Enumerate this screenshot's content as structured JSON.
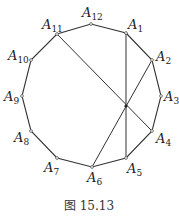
{
  "figure": {
    "caption": "图 15.13",
    "polygon": "regular dodecagon",
    "vertices": [
      {
        "name": "A",
        "sub": "1",
        "x": 126,
        "y": 33,
        "lx": 128,
        "ly": 29,
        "anchor": "start"
      },
      {
        "name": "A",
        "sub": "2",
        "x": 152,
        "y": 60,
        "lx": 156,
        "ly": 61,
        "anchor": "start"
      },
      {
        "name": "A",
        "sub": "3",
        "x": 161,
        "y": 96,
        "lx": 164,
        "ly": 101,
        "anchor": "start"
      },
      {
        "name": "A",
        "sub": "4",
        "x": 152,
        "y": 131,
        "lx": 156,
        "ly": 143,
        "anchor": "start"
      },
      {
        "name": "A",
        "sub": "5",
        "x": 126,
        "y": 158,
        "lx": 127,
        "ly": 173,
        "anchor": "start"
      },
      {
        "name": "A",
        "sub": "6",
        "x": 92,
        "y": 167,
        "lx": 87,
        "ly": 182,
        "anchor": "start"
      },
      {
        "name": "A",
        "sub": "7",
        "x": 57,
        "y": 158,
        "lx": 44,
        "ly": 172,
        "anchor": "start"
      },
      {
        "name": "A",
        "sub": "8",
        "x": 31,
        "y": 131,
        "lx": 14,
        "ly": 142,
        "anchor": "start"
      },
      {
        "name": "A",
        "sub": "9",
        "x": 22,
        "y": 96,
        "lx": 4,
        "ly": 101,
        "anchor": "start"
      },
      {
        "name": "A",
        "sub": "10",
        "x": 31,
        "y": 60,
        "lx": 8,
        "ly": 60,
        "anchor": "start"
      },
      {
        "name": "A",
        "sub": "11",
        "x": 57,
        "y": 34,
        "lx": 42,
        "ly": 29,
        "anchor": "start"
      },
      {
        "name": "A",
        "sub": "12",
        "x": 91,
        "y": 24,
        "lx": 82,
        "ly": 17,
        "anchor": "start"
      }
    ],
    "diagonals": [
      {
        "from": "A11",
        "to": "A4"
      },
      {
        "from": "A1",
        "to": "A5"
      },
      {
        "from": "A2",
        "to": "A6"
      }
    ],
    "intersection": {
      "x": 126,
      "y": 106
    }
  }
}
